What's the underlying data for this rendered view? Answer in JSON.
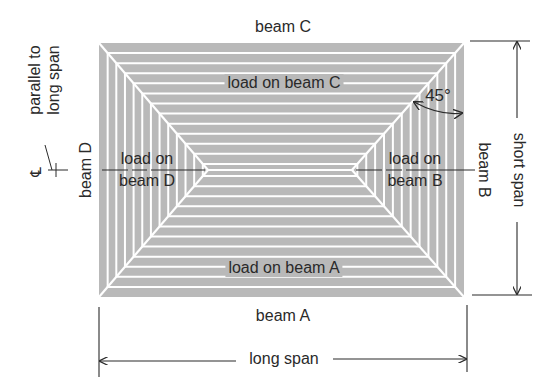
{
  "diagram": {
    "colors": {
      "slab_fill": "#b9b9b9",
      "load_lines": "#ffffff",
      "ink": "#2a2a2a"
    },
    "beams": {
      "top": "beam C",
      "bottom": "beam A",
      "left": "beam D",
      "right": "beam B"
    },
    "load_regions": {
      "top": "load on beam C",
      "bottom": "load on beam A",
      "left_line1": "load on",
      "left_line2": "beam D",
      "right_line1": "load on",
      "right_line2": "beam B"
    },
    "dimensions": {
      "horizontal": "long span",
      "vertical": "short span"
    },
    "angle_label": "45°",
    "centerline": {
      "symbol": "℄",
      "note_line1": "parallel to",
      "note_line2": "long span"
    }
  }
}
